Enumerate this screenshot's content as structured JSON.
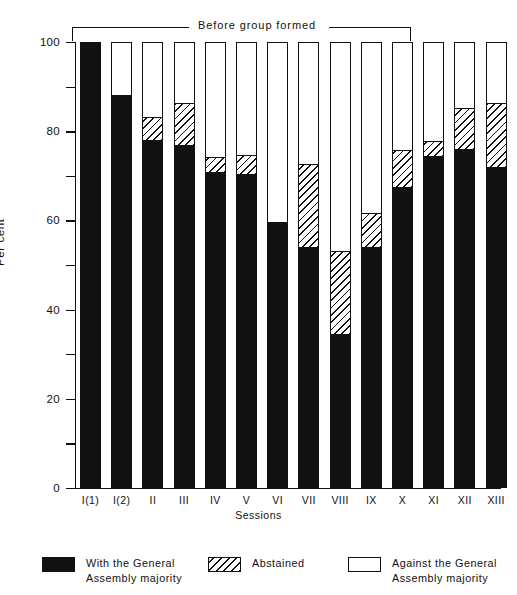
{
  "chart_data": {
    "type": "bar",
    "chart_style": "stacked vertical bar, 100% stacked",
    "title": "",
    "xlabel": "Sessions",
    "ylabel": "Per cent",
    "ylim": [
      0,
      100
    ],
    "ytick_major": [
      0,
      20,
      40,
      60,
      80,
      100
    ],
    "ytick_minor": [
      10,
      30,
      50,
      70,
      90
    ],
    "ytick_labels": [
      "0",
      "20",
      "40",
      "60",
      "80",
      "100"
    ],
    "grid": false,
    "legend_position": "bottom",
    "categories": [
      "I(1)",
      "I(2)",
      "II",
      "III",
      "IV",
      "V",
      "VI",
      "VII",
      "VIII",
      "IX",
      "X",
      "XI",
      "XII",
      "XIII"
    ],
    "series": [
      {
        "name": "With the General Assembly majority",
        "pattern": "solid-black",
        "color": "#111111",
        "values": [
          100,
          88,
          77.5,
          76.5,
          70.5,
          70,
          59.5,
          53.5,
          34,
          53.5,
          67,
          74,
          75.5,
          71.5
        ]
      },
      {
        "name": "Abstained",
        "pattern": "diagonal-hatch",
        "color": "#ffffff",
        "values": [
          0,
          0,
          5.5,
          9.5,
          3.5,
          4.5,
          0,
          19,
          19,
          8,
          8.5,
          3.5,
          9.5,
          14.5
        ]
      },
      {
        "name": "Against the General Assembly majority",
        "pattern": "open-white",
        "color": "#ffffff",
        "values": [
          0,
          12,
          17,
          14,
          26,
          25.5,
          40.5,
          27.5,
          47,
          38.5,
          24.5,
          22.5,
          15,
          14
        ]
      }
    ],
    "annotation": {
      "text": "Before group formed",
      "spans_categories": [
        "I(1)",
        "X"
      ]
    }
  },
  "axes": {
    "y_title": "Per cent",
    "x_title": "Sessions",
    "y_labels": [
      "100",
      "80",
      "60",
      "40",
      "20",
      "0"
    ],
    "x_labels": [
      "I(1)",
      "I(2)",
      "II",
      "III",
      "IV",
      "V",
      "VI",
      "VII",
      "VIII",
      "IX",
      "X",
      "XI",
      "XII",
      "XIII"
    ]
  },
  "annotation": {
    "label": "Before group formed"
  },
  "legend": {
    "items": [
      {
        "label_line1": "With the General",
        "label_line2": "Assembly majority",
        "swatch": "solid-black-swatch"
      },
      {
        "label_line1": "Abstained",
        "label_line2": "",
        "swatch": "hatched-swatch"
      },
      {
        "label_line1": "Against the General",
        "label_line2": "Assembly majority",
        "swatch": "open-white-swatch"
      }
    ]
  },
  "colors": {
    "ink": "#111111",
    "paper": "#ffffff"
  }
}
